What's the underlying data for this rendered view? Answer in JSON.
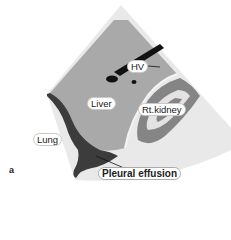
{
  "figure": {
    "panel_letter": "a",
    "labels": {
      "hv": "HV",
      "liver": "Liver",
      "kidney": "Rt.kidney",
      "lung": "Lung",
      "effusion": "Pleural effusion"
    },
    "colors": {
      "sector_light": "#e9e9e9",
      "liver": "#a9a9a9",
      "effusion": "#3c3c3c",
      "kidney_cortex": "#858585",
      "vessel": "#111111"
    }
  }
}
